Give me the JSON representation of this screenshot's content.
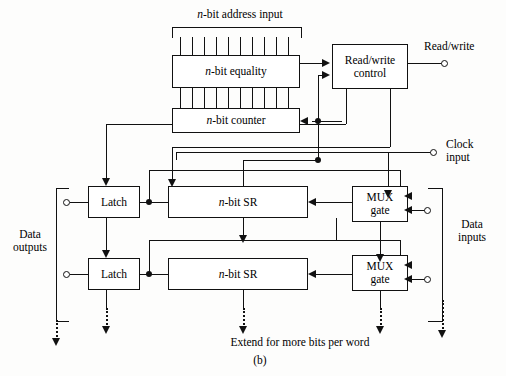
{
  "figure": {
    "caption": "(b)",
    "title_top": "n-bit address input",
    "note_bottom": "Extend for more bits per word"
  },
  "blocks": {
    "equality": "n-bit equality",
    "counter": "n-bit counter",
    "rw_control": "Read/write control",
    "rw_control_line1": "Read/write",
    "rw_control_line2": "control",
    "latch": "Latch",
    "sr": "n-bit SR",
    "mux_line1": "MUX",
    "mux_line2": "gate"
  },
  "ports": {
    "read_write": "Read/write",
    "clock_line1": "Clock",
    "clock_line2": "input",
    "data_outputs_line1": "Data",
    "data_outputs_line2": "outputs",
    "data_inputs_line1": "Data",
    "data_inputs_line2": "inputs"
  },
  "rows": [
    {
      "latch": "Latch",
      "sr": "n-bit SR",
      "mux": "MUX gate"
    },
    {
      "latch": "Latch",
      "sr": "n-bit SR",
      "mux": "MUX gate"
    }
  ],
  "bus": {
    "address_tick_count": 11,
    "interconnect_tick_count": 11
  },
  "colors": {
    "ink": "#111111",
    "paper": "#fdfdfc"
  }
}
